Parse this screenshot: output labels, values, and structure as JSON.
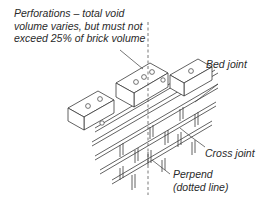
{
  "diagram": {
    "labels": {
      "perforations": "Perforations – total void\nvolume varies, but must not\nexceed 25% of brick volume",
      "bed_joint": "Bed joint",
      "cross_joint": "Cross joint",
      "perpend": "Perpend\n(dotted line)"
    },
    "colors": {
      "line": "#3a3a3a",
      "text": "#2a2a2a",
      "background": "#ffffff"
    }
  }
}
